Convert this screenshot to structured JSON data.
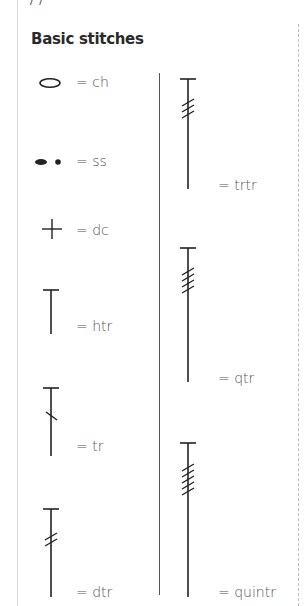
{
  "header_cut": "/ /",
  "section": {
    "title": "Basic stitches"
  },
  "stitches": [
    {
      "symbol": "oval-icon",
      "label": "= ch"
    },
    {
      "symbol": "slip-stitch-dots-icon",
      "label": "= ss"
    },
    {
      "symbol": "plus-icon",
      "label": "= dc"
    },
    {
      "symbol": "half-treble-icon",
      "label": "= htr"
    },
    {
      "symbol": "treble-icon",
      "label": "= tr"
    },
    {
      "symbol": "double-treble-icon",
      "label": "= dtr"
    },
    {
      "symbol": "triple-treble-icon",
      "label": "= trtr"
    },
    {
      "symbol": "quadruple-treble-icon",
      "label": "= qtr"
    },
    {
      "symbol": "quintuple-treble-icon",
      "label": "= quintr"
    }
  ]
}
